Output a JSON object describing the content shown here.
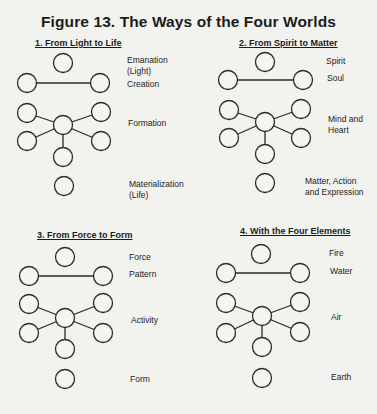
{
  "figure": {
    "title": "Figure 13. The Ways of the Four Worlds",
    "panels": [
      {
        "title": "1. From Light to Life",
        "levels": [
          "Emanation\n(Light)",
          "Creation",
          "Formation",
          "Materialization\n(Life)"
        ],
        "nodes": {
          "top": [
            63,
            63
          ],
          "pair": [
            [
              27,
              83
            ],
            [
              100,
              83
            ]
          ],
          "center": [
            63,
            125
          ],
          "spokes": [
            [
              27,
              113
            ],
            [
              101,
              112
            ],
            [
              27,
              141
            ],
            [
              101,
              141
            ],
            [
              63,
              157
            ]
          ],
          "bottom": [
            64,
            186
          ]
        }
      },
      {
        "title": "2. From Spirit to Matter",
        "levels": [
          "Spirit",
          "Soul",
          "Mind and\nHeart",
          "Matter, Action\nand Expression"
        ],
        "nodes": {
          "top": [
            265,
            62
          ],
          "pair": [
            [
              228,
              80
            ],
            [
              303,
              80
            ]
          ],
          "center": [
            265,
            122
          ],
          "spokes": [
            [
              229,
              110
            ],
            [
              301,
              109
            ],
            [
              229,
              138
            ],
            [
              301,
              138
            ],
            [
              265,
              154
            ]
          ],
          "bottom": [
            265,
            183
          ]
        }
      },
      {
        "title": "3. From Force to Form",
        "levels": [
          "Force",
          "Pattern",
          "Activity",
          "Form"
        ],
        "nodes": {
          "top": [
            65,
            257
          ],
          "pair": [
            [
              29,
              276
            ],
            [
              103,
              276
            ]
          ],
          "center": [
            65,
            318
          ],
          "spokes": [
            [
              29,
              304
            ],
            [
              103,
              303
            ],
            [
              29,
              333
            ],
            [
              103,
              333
            ],
            [
              65,
              349
            ]
          ],
          "bottom": [
            65,
            379
          ]
        }
      },
      {
        "title": "4. With the Four Elements",
        "levels": [
          "Fire",
          "Water",
          "Air",
          "Earth"
        ],
        "nodes": {
          "top": [
            261,
            254
          ],
          "pair": [
            [
              226,
              273
            ],
            [
              300,
              273
            ]
          ],
          "center": [
            262,
            316
          ],
          "spokes": [
            [
              226,
              303
            ],
            [
              300,
              302
            ],
            [
              226,
              333
            ],
            [
              300,
              332
            ],
            [
              262,
              347
            ]
          ],
          "bottom": [
            262,
            378
          ]
        }
      }
    ],
    "node_radius": 9.5
  }
}
